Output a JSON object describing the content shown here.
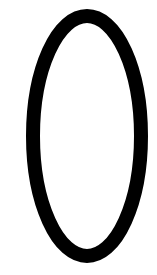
{
  "canvas": {
    "width": 157,
    "height": 275,
    "background": "#ffffff"
  },
  "shape": {
    "type": "ellipse-outline",
    "cx": 87,
    "cy": 136,
    "rx": 54,
    "ry": 120,
    "stroke": "#000000",
    "stroke_width": 14,
    "fill": "none"
  }
}
